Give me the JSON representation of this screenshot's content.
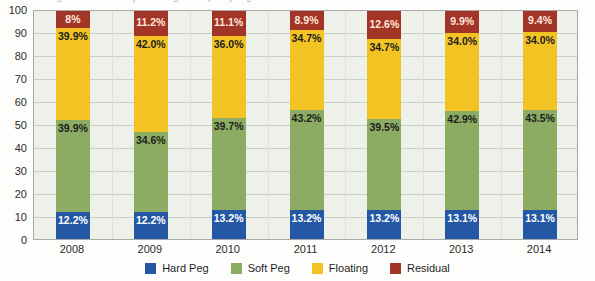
{
  "chart_data": {
    "type": "bar",
    "stacked": true,
    "title": "Percentage of countries by exchange rate policy regime",
    "xlabel": "",
    "ylabel": "",
    "ylim": [
      0,
      100
    ],
    "ytick_step": 10,
    "grid": true,
    "legend_position": "bottom",
    "categories": [
      "2008",
      "2009",
      "2010",
      "2011",
      "2012",
      "2013",
      "2014"
    ],
    "yticks": [
      "100",
      "90",
      "80",
      "70",
      "60",
      "50",
      "40",
      "30",
      "20",
      "10",
      "0"
    ],
    "series": [
      {
        "name": "Hard Peg",
        "color": "#2558a4",
        "values": [
          12.2,
          12.2,
          13.2,
          13.2,
          13.2,
          13.1,
          13.1
        ],
        "labels": [
          "12.2%",
          "12.2%",
          "13.2%",
          "13.2%",
          "13.2%",
          "13.1%",
          "13.1%"
        ]
      },
      {
        "name": "Soft Peg",
        "color": "#8cac63",
        "values": [
          39.9,
          34.6,
          39.7,
          43.2,
          39.5,
          42.9,
          43.5
        ],
        "labels": [
          "39.9%",
          "34.6%",
          "39.7%",
          "43.2%",
          "39.5%",
          "42.9%",
          "43.5%"
        ]
      },
      {
        "name": "Floating",
        "color": "#f3c324",
        "values": [
          39.9,
          42.0,
          36.0,
          34.7,
          34.7,
          34.0,
          34.0
        ],
        "labels": [
          "39.9%",
          "42.0%",
          "36.0%",
          "34.7%",
          "34.7%",
          "34.0%",
          "34.0%"
        ]
      },
      {
        "name": "Residual",
        "color": "#a33428",
        "values": [
          8.0,
          11.2,
          11.1,
          8.9,
          12.6,
          9.9,
          9.4
        ],
        "labels": [
          "8%",
          "11.2%",
          "11.1%",
          "8.9%",
          "12.6%",
          "9.9%",
          "9.4%"
        ]
      }
    ]
  },
  "colors": {
    "hard_peg": "#2558a4",
    "soft_peg": "#8cac63",
    "floating": "#f3c324",
    "residual": "#a33428",
    "plot_background": "#eef1ea",
    "gridline": "#c9cfc4",
    "axis": "#a9a9a9"
  }
}
